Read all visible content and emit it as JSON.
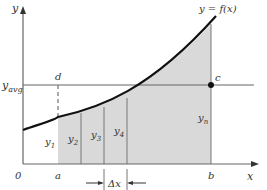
{
  "diagram": {
    "function_label": "y = f(x)",
    "axis_y_label": "y",
    "axis_x_label": "x",
    "origin_label": "0",
    "avg_label": "y",
    "avg_sub": "avg",
    "point_d": "d",
    "point_c": "c",
    "x_a": "a",
    "x_b": "b",
    "delta_x": "Δx",
    "strips": [
      {
        "label": "y",
        "sub": "1"
      },
      {
        "label": "y",
        "sub": "2"
      },
      {
        "label": "y",
        "sub": "3"
      },
      {
        "label": "y",
        "sub": "4"
      },
      {
        "label": "y",
        "sub": "n"
      }
    ],
    "colors": {
      "shade": "#d9d9d9",
      "curve": "#111111",
      "axis": "#555555",
      "dot": "#111111"
    }
  }
}
